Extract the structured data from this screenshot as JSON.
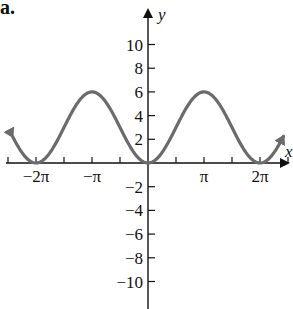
{
  "panel_label": "a.",
  "chart_data": {
    "type": "line",
    "title": "",
    "xlabel": "x",
    "ylabel": "y",
    "function": "y = 3 - 3cos(x)",
    "x_ticks": [
      "-2π",
      "-π",
      "π",
      "2π"
    ],
    "y_ticks": [
      "10",
      "8",
      "6",
      "4",
      "2",
      "-2",
      "-4",
      "-6",
      "-8",
      "-10"
    ],
    "xlim": [
      -8.2,
      8.2
    ],
    "ylim": [
      -12,
      12.5
    ],
    "series": [
      {
        "name": "curve",
        "color": "#6b6b6b",
        "x": [
          -7.6,
          -6.283,
          -4.712,
          -3.1416,
          -1.571,
          0,
          1.571,
          3.1416,
          4.712,
          6.283,
          7.6
        ],
        "y": [
          2.6,
          0,
          3,
          6,
          3,
          0,
          3,
          6,
          3,
          0,
          2.6
        ]
      }
    ],
    "grid": false,
    "legend": null
  }
}
